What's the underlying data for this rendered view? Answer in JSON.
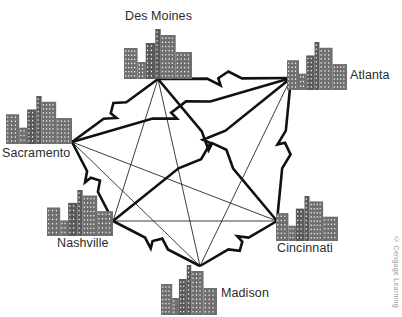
{
  "figure": {
    "kind": "network-topology-diagram",
    "credit": "© Cengage Learning",
    "colors": {
      "background": "#ffffff",
      "building": "#6f6f6f",
      "building_dark": "#5a5a5a",
      "window": "#ffffff",
      "link_thin": "#1a1a1a",
      "link_thick": "#111111",
      "label_text": "#2b2b2b",
      "credit_text": "#9a9a9a"
    }
  },
  "nodes": [
    {
      "id": "des_moines",
      "label": "Des Moines",
      "label_x": 125,
      "label_y": 9,
      "label_align": "left",
      "skyline_x": 124,
      "skyline_y": 29,
      "skyline_w": 68,
      "skyline_h": 50,
      "hub_x": 158,
      "hub_y": 79
    },
    {
      "id": "atlanta",
      "label": "Atlanta",
      "label_x": 350,
      "label_y": 68,
      "label_align": "left",
      "skyline_x": 287,
      "skyline_y": 42,
      "skyline_w": 60,
      "skyline_h": 48,
      "hub_x": 291,
      "hub_y": 78
    },
    {
      "id": "sacramento",
      "label": "Sacramento",
      "label_x": 2,
      "label_y": 146,
      "label_align": "left",
      "skyline_x": 6,
      "skyline_y": 96,
      "skyline_w": 66,
      "skyline_h": 48,
      "hub_x": 72,
      "hub_y": 142
    },
    {
      "id": "nashville",
      "label": "Nashville",
      "label_x": 57,
      "label_y": 236,
      "label_align": "left",
      "skyline_x": 47,
      "skyline_y": 190,
      "skyline_w": 66,
      "skyline_h": 46,
      "hub_x": 113,
      "hub_y": 221
    },
    {
      "id": "cincinnati",
      "label": "Cincinnati",
      "label_x": 277,
      "label_y": 241,
      "label_align": "left",
      "skyline_x": 276,
      "skyline_y": 196,
      "skyline_w": 62,
      "skyline_h": 45,
      "hub_x": 277,
      "hub_y": 221
    },
    {
      "id": "madison",
      "label": "Madison",
      "label_x": 221,
      "label_y": 286,
      "label_align": "left",
      "skyline_x": 161,
      "skyline_y": 265,
      "skyline_w": 56,
      "skyline_h": 50,
      "hub_x": 200,
      "hub_y": 266
    }
  ],
  "links": [
    {
      "from": "sacramento",
      "to": "des_moines",
      "style": "bolt"
    },
    {
      "from": "sacramento",
      "to": "atlanta",
      "style": "bolt"
    },
    {
      "from": "sacramento",
      "to": "nashville",
      "style": "bolt"
    },
    {
      "from": "sacramento",
      "to": "cincinnati",
      "style": "thin"
    },
    {
      "from": "sacramento",
      "to": "madison",
      "style": "thin"
    },
    {
      "from": "des_moines",
      "to": "atlanta",
      "style": "bolt"
    },
    {
      "from": "des_moines",
      "to": "nashville",
      "style": "thin"
    },
    {
      "from": "des_moines",
      "to": "cincinnati",
      "style": "bolt"
    },
    {
      "from": "des_moines",
      "to": "madison",
      "style": "thin"
    },
    {
      "from": "atlanta",
      "to": "nashville",
      "style": "bolt"
    },
    {
      "from": "atlanta",
      "to": "cincinnati",
      "style": "bolt"
    },
    {
      "from": "atlanta",
      "to": "madison",
      "style": "thin"
    },
    {
      "from": "nashville",
      "to": "cincinnati",
      "style": "thin"
    },
    {
      "from": "nashville",
      "to": "madison",
      "style": "bolt"
    },
    {
      "from": "cincinnati",
      "to": "madison",
      "style": "bolt"
    }
  ],
  "skyline_profiles": {
    "default": [
      {
        "x": 0.0,
        "w": 0.2,
        "h": 0.62,
        "tone": "light"
      },
      {
        "x": 0.2,
        "w": 0.12,
        "h": 0.34,
        "tone": "light"
      },
      {
        "x": 0.32,
        "w": 0.14,
        "h": 0.72,
        "tone": "dark"
      },
      {
        "x": 0.46,
        "w": 0.08,
        "h": 1.0,
        "tone": "dark"
      },
      {
        "x": 0.54,
        "w": 0.22,
        "h": 0.88,
        "tone": "light"
      },
      {
        "x": 0.76,
        "w": 0.24,
        "h": 0.54,
        "tone": "light"
      }
    ]
  }
}
